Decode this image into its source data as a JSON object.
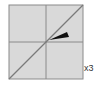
{
  "icon": {
    "name": "zoom-scale-diagram",
    "multiplier_label": "x3",
    "colors": {
      "background": "#d8d8d8",
      "border": "#808080",
      "grid": "#808080",
      "diagonal": "#808080",
      "wedge": "#111111"
    }
  }
}
